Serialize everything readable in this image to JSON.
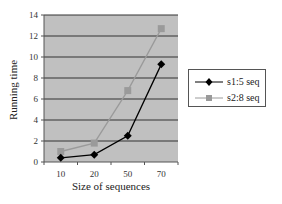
{
  "chart_data": {
    "type": "line",
    "title": "",
    "xlabel": "Size of sequences",
    "ylabel": "Running time",
    "categories": [
      "10",
      "20",
      "50",
      "70"
    ],
    "ylim": [
      0,
      14
    ],
    "yticks": [
      0,
      2,
      4,
      6,
      8,
      10,
      12,
      14
    ],
    "grid": true,
    "legend_position": "right",
    "plot_background": "#c0c0c0",
    "series": [
      {
        "name": "s1:5 seq",
        "values": [
          0.4,
          0.7,
          2.5,
          9.3
        ],
        "color": "#000000",
        "marker": "diamond"
      },
      {
        "name": "s2:8 seq",
        "values": [
          1.0,
          1.8,
          6.8,
          12.7
        ],
        "color": "#9a9a9a",
        "marker": "square"
      }
    ]
  }
}
